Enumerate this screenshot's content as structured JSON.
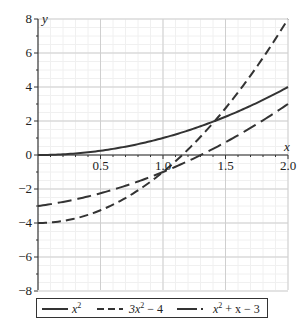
{
  "chart_data": {
    "type": "line",
    "title": "",
    "xlabel": "x",
    "ylabel": "y",
    "xlim": [
      0,
      2
    ],
    "ylim": [
      -8,
      8
    ],
    "x_ticks": [
      "0.5",
      "1.0",
      "1.5",
      "2.0"
    ],
    "y_ticks": [
      "8",
      "6",
      "4",
      "2",
      "0",
      "-2",
      "-4",
      "-6",
      "-8"
    ],
    "grid": true,
    "legend_position": "bottom",
    "series": [
      {
        "name": "x^2",
        "label_base": "x",
        "label_sup": "2",
        "label_rest": "",
        "style": "solid",
        "x": [
          0,
          0.5,
          1.0,
          1.5,
          2.0
        ],
        "values": [
          0,
          0.25,
          1,
          2.25,
          4
        ]
      },
      {
        "name": "3x^2 - 4",
        "label_base": "3x",
        "label_sup": "2",
        "label_rest": " − 4",
        "style": "dashed",
        "x": [
          0,
          0.5,
          1.0,
          1.5,
          2.0
        ],
        "values": [
          -4,
          -3.25,
          -1,
          2.75,
          8
        ]
      },
      {
        "name": "x^2 + x - 3",
        "label_base": "x",
        "label_sup": "2",
        "label_rest": " + x − 3",
        "style": "dash-dot",
        "x": [
          0,
          0.5,
          1.0,
          1.5,
          2.0
        ],
        "values": [
          -3,
          -2.25,
          -1,
          0.75,
          3
        ]
      }
    ]
  },
  "axes": {
    "x_name": "x",
    "y_name": "y"
  },
  "legend": {
    "items": [
      {
        "base": "x",
        "sup": "2",
        "rest": ""
      },
      {
        "base": "3x",
        "sup": "2",
        "rest": " − 4"
      },
      {
        "base": "x",
        "sup": "2",
        "rest": " + x − 3"
      }
    ]
  }
}
